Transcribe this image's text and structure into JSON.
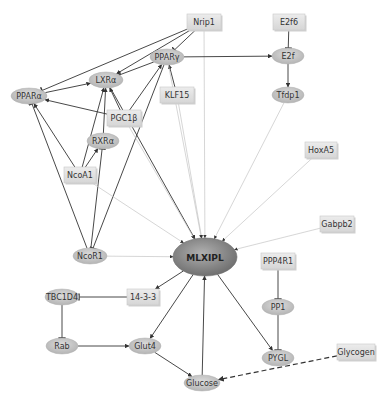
{
  "diagram": {
    "hub": {
      "id": "MLXIPL",
      "label": "MLXIPL",
      "x": 205,
      "y": 257,
      "rx": 32,
      "ry": 19
    },
    "nodes": [
      {
        "id": "Nrip1",
        "label": "Nrip1",
        "shape": "rect",
        "x": 204,
        "y": 22,
        "w": 34,
        "h": 16
      },
      {
        "id": "E2f6",
        "label": "E2f6",
        "shape": "rect",
        "x": 289,
        "y": 22,
        "w": 32,
        "h": 16
      },
      {
        "id": "PPARg",
        "label": "PPARγ",
        "shape": "ellipse",
        "x": 167,
        "y": 57,
        "w": 34,
        "h": 16
      },
      {
        "id": "E2f",
        "label": "E2f",
        "shape": "ellipse",
        "x": 288,
        "y": 56,
        "w": 32,
        "h": 16
      },
      {
        "id": "LXRa",
        "label": "LXRα",
        "shape": "ellipse",
        "x": 106,
        "y": 80,
        "w": 34,
        "h": 16
      },
      {
        "id": "PPARa",
        "label": "PPARα",
        "shape": "ellipse",
        "x": 29,
        "y": 96,
        "w": 36,
        "h": 16
      },
      {
        "id": "KLF15",
        "label": "KLF15",
        "shape": "rect",
        "x": 177,
        "y": 95,
        "w": 34,
        "h": 16
      },
      {
        "id": "Tfdp1",
        "label": "Tfdp1",
        "shape": "ellipse",
        "x": 288,
        "y": 95,
        "w": 32,
        "h": 16
      },
      {
        "id": "PGC1b",
        "label": "PGC1β",
        "shape": "rect",
        "x": 124,
        "y": 118,
        "w": 34,
        "h": 16
      },
      {
        "id": "RXRa",
        "label": "RXRα",
        "shape": "ellipse",
        "x": 103,
        "y": 141,
        "w": 32,
        "h": 16
      },
      {
        "id": "HoxA5",
        "label": "HoxA5",
        "shape": "rect",
        "x": 321,
        "y": 150,
        "w": 32,
        "h": 16
      },
      {
        "id": "NcoA1",
        "label": "NcoA1",
        "shape": "rect",
        "x": 80,
        "y": 175,
        "w": 32,
        "h": 16
      },
      {
        "id": "Gabpb2",
        "label": "Gabpb2",
        "shape": "rect",
        "x": 337,
        "y": 224,
        "w": 34,
        "h": 16
      },
      {
        "id": "NcoR1",
        "label": "NcoR1",
        "shape": "ellipse",
        "x": 90,
        "y": 256,
        "w": 34,
        "h": 16
      },
      {
        "id": "PPP4R1",
        "label": "PPP4R1",
        "shape": "rect",
        "x": 278,
        "y": 261,
        "w": 34,
        "h": 16
      },
      {
        "id": "TBC1D4",
        "label": "TBC1D4",
        "shape": "ellipse",
        "x": 62,
        "y": 297,
        "w": 34,
        "h": 16
      },
      {
        "id": "1433",
        "label": "14-3-3",
        "shape": "rect",
        "x": 143,
        "y": 297,
        "w": 32,
        "h": 16
      },
      {
        "id": "PP1",
        "label": "PP1",
        "shape": "ellipse",
        "x": 278,
        "y": 307,
        "w": 32,
        "h": 16
      },
      {
        "id": "Rab",
        "label": "Rab",
        "shape": "ellipse",
        "x": 62,
        "y": 346,
        "w": 32,
        "h": 16
      },
      {
        "id": "Glut4",
        "label": "Glut4",
        "shape": "ellipse",
        "x": 145,
        "y": 346,
        "w": 32,
        "h": 16
      },
      {
        "id": "PYGL",
        "label": "PYGL",
        "shape": "ellipse",
        "x": 278,
        "y": 358,
        "w": 32,
        "h": 16
      },
      {
        "id": "Glycogen",
        "label": "Glycogen",
        "shape": "rect",
        "x": 356,
        "y": 352,
        "w": 38,
        "h": 16
      },
      {
        "id": "Glucose",
        "label": "Glucose",
        "shape": "ellipse",
        "x": 202,
        "y": 383,
        "w": 36,
        "h": 16
      }
    ],
    "edges": [
      {
        "from": "Nrip1",
        "to": "PPARa",
        "type": "inhibit",
        "style": "solid"
      },
      {
        "from": "Nrip1",
        "to": "LXRa",
        "type": "activate",
        "style": "solid"
      },
      {
        "from": "Nrip1",
        "to": "PPARg",
        "type": "inhibit",
        "style": "solid"
      },
      {
        "from": "Nrip1",
        "to": "MLXIPL",
        "type": "activate",
        "style": "faint"
      },
      {
        "from": "E2f6",
        "to": "E2f",
        "type": "inhibit",
        "style": "solid"
      },
      {
        "from": "PPARg",
        "to": "E2f",
        "type": "activate",
        "style": "solid"
      },
      {
        "from": "E2f",
        "to": "Tfdp1",
        "type": "activate",
        "style": "solid"
      },
      {
        "from": "PPARg",
        "to": "LXRa",
        "type": "inhibit",
        "style": "solid"
      },
      {
        "from": "PPARa",
        "to": "LXRa",
        "type": "activate",
        "style": "solid"
      },
      {
        "from": "PGC1b",
        "to": "PPARa",
        "type": "activate",
        "style": "solid"
      },
      {
        "from": "PGC1b",
        "to": "LXRa",
        "type": "activate",
        "style": "solid"
      },
      {
        "from": "PGC1b",
        "to": "PPARg",
        "type": "activate",
        "style": "solid"
      },
      {
        "from": "KLF15",
        "to": "PPARg",
        "type": "activate",
        "style": "solid"
      },
      {
        "from": "RXRa",
        "to": "LXRa",
        "type": "activate",
        "style": "solid"
      },
      {
        "from": "NcoA1",
        "to": "PPARa",
        "type": "activate",
        "style": "solid"
      },
      {
        "from": "NcoA1",
        "to": "LXRa",
        "type": "activate",
        "style": "solid"
      },
      {
        "from": "NcoA1",
        "to": "RXRa",
        "type": "activate",
        "style": "solid"
      },
      {
        "from": "NcoR1",
        "to": "PPARa",
        "type": "inhibit",
        "style": "solid"
      },
      {
        "from": "NcoR1",
        "to": "RXRa",
        "type": "inhibit",
        "style": "solid"
      },
      {
        "from": "PPARg",
        "to": "NcoR1",
        "type": "inhibit",
        "style": "solid"
      },
      {
        "from": "LXRa",
        "to": "MLXIPL",
        "type": "activate",
        "style": "solid"
      },
      {
        "from": "PPARg",
        "to": "MLXIPL",
        "type": "activate",
        "style": "faint"
      },
      {
        "from": "KLF15",
        "to": "MLXIPL",
        "type": "activate",
        "style": "faint"
      },
      {
        "from": "PGC1b",
        "to": "MLXIPL",
        "type": "activate",
        "style": "faint"
      },
      {
        "from": "NcoA1",
        "to": "MLXIPL",
        "type": "activate",
        "style": "faint"
      },
      {
        "from": "Tfdp1",
        "to": "MLXIPL",
        "type": "activate",
        "style": "faint"
      },
      {
        "from": "HoxA5",
        "to": "MLXIPL",
        "type": "activate",
        "style": "faint"
      },
      {
        "from": "Gabpb2",
        "to": "MLXIPL",
        "type": "activate",
        "style": "faint"
      },
      {
        "from": "NcoR1",
        "to": "MLXIPL",
        "type": "activate",
        "style": "faint"
      },
      {
        "from": "MLXIPL",
        "to": "1433",
        "type": "activate",
        "style": "solid"
      },
      {
        "from": "1433",
        "to": "TBC1D4",
        "type": "inhibit",
        "style": "solid"
      },
      {
        "from": "TBC1D4",
        "to": "Rab",
        "type": "inhibit",
        "style": "solid"
      },
      {
        "from": "Rab",
        "to": "Glut4",
        "type": "activate",
        "style": "solid"
      },
      {
        "from": "MLXIPL",
        "to": "Glut4",
        "type": "activate",
        "style": "solid"
      },
      {
        "from": "Glut4",
        "to": "Glucose",
        "type": "activate",
        "style": "solid"
      },
      {
        "from": "Glucose",
        "to": "MLXIPL",
        "type": "activate",
        "style": "solid"
      },
      {
        "from": "MLXIPL",
        "to": "PYGL",
        "type": "activate",
        "style": "solid"
      },
      {
        "from": "PPP4R1",
        "to": "PP1",
        "type": "inhibit",
        "style": "solid"
      },
      {
        "from": "PP1",
        "to": "PYGL",
        "type": "inhibit",
        "style": "solid"
      },
      {
        "from": "Glycogen",
        "to": "Glucose",
        "type": "activate",
        "style": "dashed"
      }
    ],
    "colors": {
      "rect_fill": "#e2e2e2",
      "rect_border": "#c8c8c8",
      "ellipse_fill": "#c8c8c8",
      "hub_fill": "#8a8a8a",
      "edge_solid": "#333333",
      "edge_faint": "#c4c4c4"
    }
  }
}
